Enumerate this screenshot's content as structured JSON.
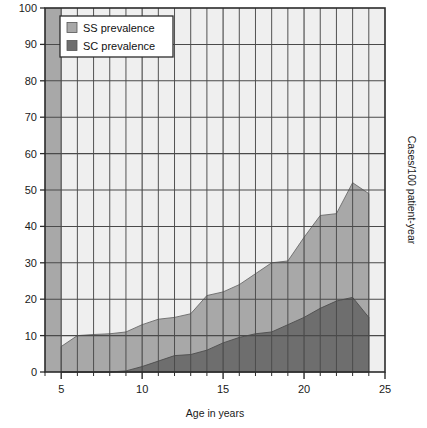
{
  "chart_data": {
    "type": "area",
    "title": "",
    "subtitle": "",
    "xlabel": "Age in years",
    "ylabel": "Cases/100 patient-year",
    "xlim": [
      4,
      25
    ],
    "ylim": [
      0,
      100
    ],
    "xticks": [
      5,
      10,
      15,
      20,
      25
    ],
    "xtick_labels": [
      "5",
      "10",
      "15",
      "20",
      "25"
    ],
    "yticks": [
      0,
      10,
      20,
      30,
      40,
      50,
      60,
      70,
      80,
      90,
      100
    ],
    "ytick_labels": [
      "0",
      "10",
      "20",
      "30",
      "40",
      "50",
      "60",
      "70",
      "80",
      "90",
      "100"
    ],
    "grid": true,
    "grid_minor_x": true,
    "stacked": false,
    "legend_position": "top-left",
    "x": [
      5,
      6,
      7,
      8,
      9,
      10,
      11,
      12,
      13,
      14,
      15,
      16,
      17,
      18,
      19,
      20,
      21,
      22,
      23,
      24
    ],
    "series": [
      {
        "name": "SS prevalence",
        "label": "SS prevalence",
        "color": "#a8a8a8",
        "values": [
          7,
          10,
          10.3,
          10.5,
          11,
          13,
          14.5,
          15,
          16,
          21,
          22,
          24,
          27,
          30,
          30.5,
          37,
          43,
          43.5,
          52,
          49
        ]
      },
      {
        "name": "SC prevalence",
        "label": "SC prevalence",
        "color": "#6e6e6e",
        "values": [
          0,
          0,
          0,
          0,
          0.3,
          1.5,
          3,
          4.5,
          4.8,
          6,
          8,
          9.5,
          10.5,
          11,
          13,
          15,
          17.5,
          19.5,
          20.5,
          15
        ]
      }
    ]
  },
  "legend": {
    "items": [
      {
        "label": "SS prevalence",
        "swatch_color": "#a8a8a8"
      },
      {
        "label": "SC prevalence",
        "swatch_color": "#6e6e6e"
      }
    ]
  },
  "axes": {
    "x_title": "Age in years",
    "y_title": "Cases/100 patient-year",
    "x_tick_labels": [
      "5",
      "10",
      "15",
      "20",
      "25"
    ],
    "y_tick_labels": [
      "100",
      "90",
      "80",
      "70",
      "60",
      "50",
      "40",
      "30",
      "20",
      "10",
      "0"
    ]
  },
  "colors": {
    "background": "#ffffff",
    "plot_background": "#efefef",
    "outside_band": "#a8a8a8",
    "ss_fill": "#a8a8a8",
    "sc_fill": "#6e6e6e",
    "grid_line": "#4a4a4a",
    "frame": "#2b2b2b",
    "text": "#1a1a1a"
  }
}
